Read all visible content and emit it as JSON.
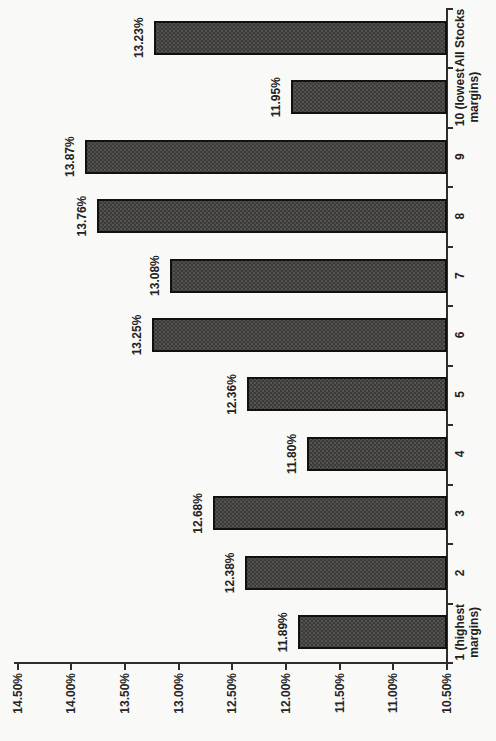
{
  "page": {
    "background_color": "#f9f9f7",
    "rotation_note": "chart printed rotated 90 degrees counter-clockwise on the page"
  },
  "chart_data": {
    "type": "bar",
    "title": "",
    "xlabel": "",
    "ylabel": "",
    "categories": [
      "1 (highest margins)",
      "2",
      "3",
      "4",
      "5",
      "6",
      "7",
      "8",
      "9",
      "10 (lowest margins)",
      "All Stocks"
    ],
    "category_display_lines": [
      [
        "1 (highest",
        "margins)"
      ],
      [
        "2"
      ],
      [
        "3"
      ],
      [
        "4"
      ],
      [
        "5"
      ],
      [
        "6"
      ],
      [
        "7"
      ],
      [
        "8"
      ],
      [
        "9"
      ],
      [
        "10 (lowest",
        "margins)"
      ],
      [
        "All Stocks"
      ]
    ],
    "values": [
      11.89,
      12.38,
      12.68,
      11.8,
      12.36,
      13.25,
      13.08,
      13.76,
      13.87,
      11.95,
      13.23
    ],
    "bar_labels": [
      "11.89%",
      "12.38%",
      "12.68%",
      "11.80%",
      "12.36%",
      "13.25%",
      "13.08%",
      "13.76%",
      "13.87%",
      "11.95%",
      "13.23%"
    ],
    "ylim": [
      10.5,
      14.5
    ],
    "ytick_values": [
      10.5,
      11.0,
      11.5,
      12.0,
      12.5,
      13.0,
      13.5,
      14.0,
      14.5
    ],
    "ytick_labels": [
      "10.50%",
      "11.00%",
      "11.50%",
      "12.00%",
      "12.50%",
      "13.00%",
      "13.50%",
      "14.00%",
      "14.50%"
    ],
    "grid": false,
    "legend": "none",
    "bar_color": "#3b3a38",
    "bar_border_color": "#121110",
    "axis_color": "#2e2d2b",
    "rotated_on_page_deg": -90
  }
}
